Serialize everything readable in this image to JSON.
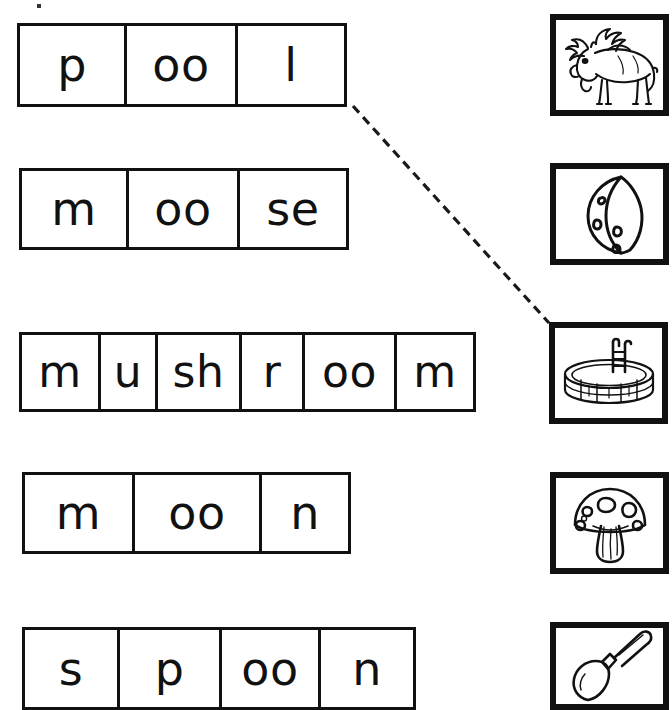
{
  "worksheet": {
    "title": "oo words picture match worksheet",
    "background_color": "#ffffff",
    "ink_color": "#111111",
    "width": 672,
    "height": 710
  },
  "words": [
    {
      "id": "word-pool",
      "answer": "pool",
      "segments": [
        "p",
        "oo",
        "l"
      ],
      "x": 17,
      "y": 23,
      "height": 84,
      "seg_widths": [
        110,
        114,
        112
      ],
      "font_size": 46
    },
    {
      "id": "word-moose",
      "answer": "moose",
      "segments": [
        "m",
        "oo",
        "se"
      ],
      "x": 19,
      "y": 168,
      "height": 82,
      "seg_widths": [
        110,
        114,
        112
      ],
      "font_size": 46
    },
    {
      "id": "word-mushroom",
      "answer": "mushroom",
      "segments": [
        "m",
        "u",
        "sh",
        "r",
        "oo",
        "m"
      ],
      "x": 19,
      "y": 332,
      "height": 80,
      "seg_widths": [
        82,
        60,
        87,
        66,
        95,
        82
      ],
      "font_size": 44
    },
    {
      "id": "word-moon",
      "answer": "moon",
      "segments": [
        "m",
        "oo",
        "n"
      ],
      "x": 22,
      "y": 472,
      "height": 82,
      "seg_widths": [
        113,
        130,
        92
      ],
      "font_size": 46
    },
    {
      "id": "word-spoon",
      "answer": "spoon",
      "segments": [
        "s",
        "p",
        "oo",
        "n"
      ],
      "x": 22,
      "y": 627,
      "height": 83,
      "seg_widths": [
        98,
        105,
        102,
        98
      ],
      "font_size": 46
    }
  ],
  "pictures": [
    {
      "id": "picture-moose",
      "icon": "moose-icon",
      "label": "moose",
      "x": 550,
      "y": 14,
      "width": 119,
      "height": 102
    },
    {
      "id": "picture-moon",
      "icon": "moon-icon",
      "label": "moon",
      "x": 550,
      "y": 163,
      "width": 119,
      "height": 102
    },
    {
      "id": "picture-pool",
      "icon": "pool-icon",
      "label": "pool",
      "x": 549,
      "y": 322,
      "width": 119,
      "height": 102
    },
    {
      "id": "picture-mushroom",
      "icon": "mushroom-icon",
      "label": "mushroom",
      "x": 550,
      "y": 472,
      "width": 119,
      "height": 102
    },
    {
      "id": "picture-spoon",
      "icon": "spoon-icon",
      "label": "spoon",
      "x": 550,
      "y": 622,
      "width": 119,
      "height": 88
    }
  ],
  "connections": [
    {
      "id": "connector-pool",
      "from": "word-pool",
      "to": "picture-pool",
      "style": "dashed",
      "color": "#1a1a1a",
      "x1": 353,
      "y1": 106,
      "x2": 549,
      "y2": 323
    }
  ]
}
